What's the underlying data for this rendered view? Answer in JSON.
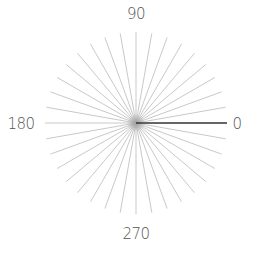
{
  "diagram": {
    "type": "radial-angle-dial",
    "center": [
      136,
      123
    ],
    "radius": 91,
    "spoke_step_degrees": 10,
    "spoke_count": 36,
    "spoke_color": "#c9c9c9",
    "selected_angle": 0,
    "selected_color": "#333333",
    "center_glow_color": "#9a9a9a"
  },
  "labels": {
    "right": {
      "text": "0",
      "x": 237,
      "y": 124
    },
    "top": {
      "text": "90",
      "x": 136,
      "y": 14
    },
    "left": {
      "text": "180",
      "x": 21,
      "y": 124
    },
    "bottom": {
      "text": "270",
      "x": 136,
      "y": 234
    }
  }
}
